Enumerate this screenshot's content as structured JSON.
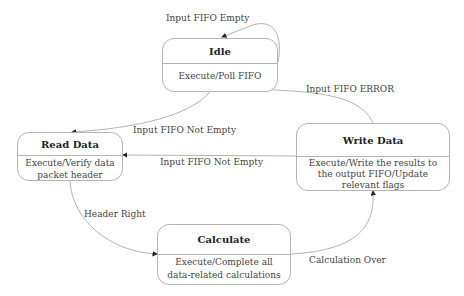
{
  "states": {
    "idle": {
      "title": "Idle",
      "action": "Execute/Poll FIFO"
    },
    "read": {
      "title": "Read Data",
      "action_line1": "Execute/Verify data",
      "action_line2": "packet header"
    },
    "write": {
      "title": "Write Data",
      "action_line1": "Execute/Write the results to",
      "action_line2": "the output FIFO/Update",
      "action_line3": "relevant flags"
    },
    "calc": {
      "title": "Calculate",
      "action_line1": "Execute/Complete all",
      "action_line2": "data-related calculations"
    }
  },
  "transitions": {
    "idle_self": "Input FIFO Empty",
    "idle_to_read": "Input FIFO Not Empty",
    "write_to_idle": "Input FIFO ERROR",
    "write_to_read": "Input FIFO Not Empty",
    "read_to_calc": "Header Right",
    "calc_to_write": "Calculation Over"
  },
  "colors": {
    "edge": "#aaaaaa",
    "border": "#b5b5b5",
    "arrow": "#222222"
  }
}
